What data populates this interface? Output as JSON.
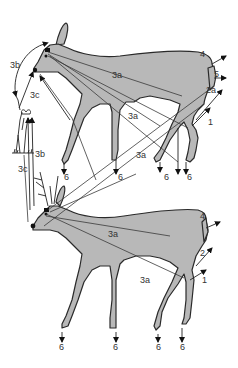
{
  "diagram": {
    "figures": [
      {
        "name": "doe-grazing-upper",
        "description": "Doe standing, head turned toward plant"
      },
      {
        "name": "buck-lower",
        "description": "Buck with antlers, head lowered"
      }
    ],
    "labels": {
      "upper": {
        "l3b": "3b",
        "l3c": "3c",
        "l3a_body": "3a",
        "l3a_mid": "3a",
        "l3a_lower": "3a",
        "l4": "4",
        "l5": "5",
        "l2a": "2a",
        "l1": "1",
        "l6_front": "6",
        "l6_mid": "6",
        "l6_hind1": "6",
        "l6_hind2": "6"
      },
      "lower": {
        "l3b": "3b",
        "l3c": "3c",
        "l3a_body": "3a",
        "l3a_leg": "3a",
        "l4": "4",
        "l2": "2",
        "l1": "1",
        "l6_front1": "6",
        "l6_front2": "6",
        "l6_hind1": "6",
        "l6_hind2": "6"
      }
    },
    "colors": {
      "body": "#b8b8b8",
      "outline": "#2a2a2a",
      "lines": "#3a3a3a"
    }
  }
}
